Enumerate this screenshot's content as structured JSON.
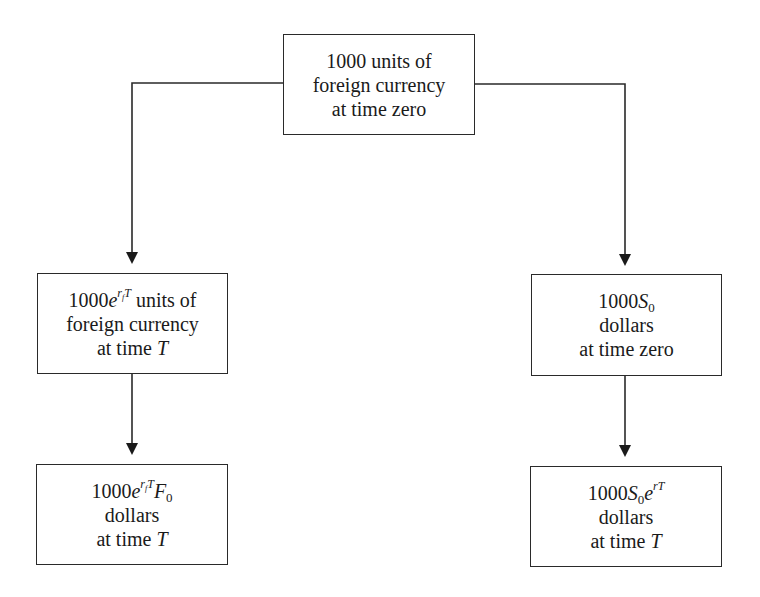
{
  "diagram": {
    "type": "flowchart",
    "colors": {
      "line": "#2a2a2a",
      "text": "#1a1a1a",
      "background": "#ffffff"
    },
    "nodes": {
      "top": {
        "lines": [
          "1000 units of",
          "foreign currency",
          "at time zero"
        ]
      },
      "left_mid": {
        "line1": {
          "base": "1000",
          "exp_var": "e",
          "exp_r": "r",
          "exp_r_sub": "f",
          "exp_T": "T",
          "suffix": " units of"
        },
        "lines": [
          "foreign currency",
          "at time "
        ],
        "time_var": "T"
      },
      "left_bot": {
        "line1": {
          "base": "1000",
          "exp_var": "e",
          "exp_r": "r",
          "exp_r_sub": "f",
          "exp_T": "T",
          "F": "F",
          "F_sub": "0"
        },
        "lines": [
          "dollars",
          "at time "
        ],
        "time_var": "T"
      },
      "right_mid": {
        "line1": {
          "base": "1000",
          "S": "S",
          "S_sub": "0"
        },
        "lines": [
          "dollars",
          "at time zero"
        ]
      },
      "right_bot": {
        "line1": {
          "base": "1000",
          "S": "S",
          "S_sub": "0",
          "exp_var": "e",
          "exp": "rT"
        },
        "lines": [
          "dollars",
          "at time "
        ],
        "time_var": "T"
      }
    },
    "edges": [
      {
        "from": "top",
        "to": "left_mid"
      },
      {
        "from": "top",
        "to": "right_mid"
      },
      {
        "from": "left_mid",
        "to": "left_bot"
      },
      {
        "from": "right_mid",
        "to": "right_bot"
      }
    ]
  }
}
